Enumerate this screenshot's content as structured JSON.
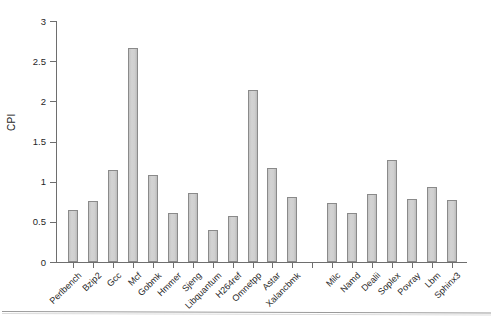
{
  "chart_data": {
    "type": "bar",
    "title": "",
    "xlabel": "",
    "ylabel": "CPI",
    "ylim": [
      0,
      3
    ],
    "ytick_labels": [
      "0",
      "0.5",
      "1",
      "1.5",
      "2",
      "2.5",
      "3"
    ],
    "ytick_values": [
      0,
      0.5,
      1,
      1.5,
      2,
      2.5,
      3
    ],
    "grid": false,
    "legend": "none",
    "bar_color": "#cccccc",
    "bar_edge_color": "#8a8a8a",
    "axis_color": "#6e6e6e",
    "categories": [
      "Perlbench",
      "Bzip2",
      "Gcc",
      "Mcf",
      "Gobmk",
      "Hmmer",
      "Sjeng",
      "Libquantum",
      "H264ref",
      "Omnetpp",
      "Astar",
      "Xalancbmk",
      "",
      "Milc",
      "Namd",
      "Dealii",
      "Soplex",
      "Povray",
      "Lbm",
      "Sphinx3"
    ],
    "values": [
      0.65,
      0.76,
      1.14,
      2.66,
      1.08,
      0.61,
      0.86,
      0.4,
      0.57,
      2.14,
      1.17,
      0.81,
      null,
      0.74,
      0.61,
      0.85,
      1.27,
      0.79,
      0.93,
      0.77
    ]
  }
}
